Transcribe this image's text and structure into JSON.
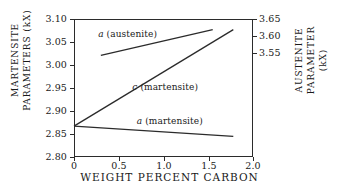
{
  "chart_data": {
    "type": "line",
    "title": "",
    "xlabel": "WEIGHT PERCENT CARBON",
    "ylabel": "MARTENSITE PARAMETERS (kX)",
    "ylabel_right": "AUSTENITE PARAMETER (kX)",
    "xlim": [
      0,
      2.0
    ],
    "ylim": [
      2.8,
      3.1
    ],
    "ylim_right": [
      3.4,
      3.65
    ],
    "grid": false,
    "legend": "inline annotations",
    "xticks": [
      "0",
      "0.5",
      "1.0",
      "1.5",
      "2.0"
    ],
    "xtick_values": [
      0,
      0.5,
      1.0,
      1.5,
      2.0
    ],
    "yticks_left": [
      "3.10",
      "3.05",
      "3.00",
      "2.95",
      "2.90",
      "2.85",
      "2.80"
    ],
    "ytick_values_left": [
      3.1,
      3.05,
      3.0,
      2.95,
      2.9,
      2.85,
      2.8
    ],
    "yticks_right": [
      "3.65",
      "3.60",
      "3.55"
    ],
    "ytick_values_right": [
      3.65,
      3.6,
      3.55
    ],
    "series": [
      {
        "name": "a (austenite)",
        "symbol": "a",
        "phase": "(austenite)",
        "axis": "right",
        "x": [
          0.3,
          1.55
        ],
        "y": [
          3.57,
          3.622
        ],
        "y_left_scale": [
          3.021,
          3.077
        ]
      },
      {
        "name": "c (martensite)",
        "symbol": "c",
        "phase": "(martensite)",
        "axis": "left",
        "x": [
          0.0,
          1.78
        ],
        "y": [
          2.867,
          3.077
        ]
      },
      {
        "name": "a (martensite)",
        "symbol": "a",
        "phase": "(martensite)",
        "axis": "left",
        "x": [
          0.0,
          1.78
        ],
        "y": [
          2.867,
          2.845
        ]
      }
    ],
    "annotations": [
      {
        "text": "a (austenite)",
        "symbol": "a",
        "rest": " (austenite)",
        "x": 0.6,
        "y": 3.068
      },
      {
        "text": "c (martensite)",
        "symbol": "c",
        "rest": " (martensite)",
        "x": 1.02,
        "y": 2.953
      },
      {
        "text": "a (martensite)",
        "symbol": "a",
        "rest": " (martensite)",
        "x": 1.07,
        "y": 2.878
      }
    ],
    "colors": {
      "line": "#2b2b2b",
      "axis": "#2b2b2b",
      "background": "#ffffff",
      "text": "#1a1a1a"
    }
  },
  "axes": {
    "left_title_lines": [
      "MARTENSITE",
      "PARAMETERS  (kX)"
    ],
    "right_title_lines": [
      "AUSTENITE",
      "PARAMETER",
      "(kX)"
    ],
    "x_title": "WEIGHT PERCENT CARBON"
  }
}
